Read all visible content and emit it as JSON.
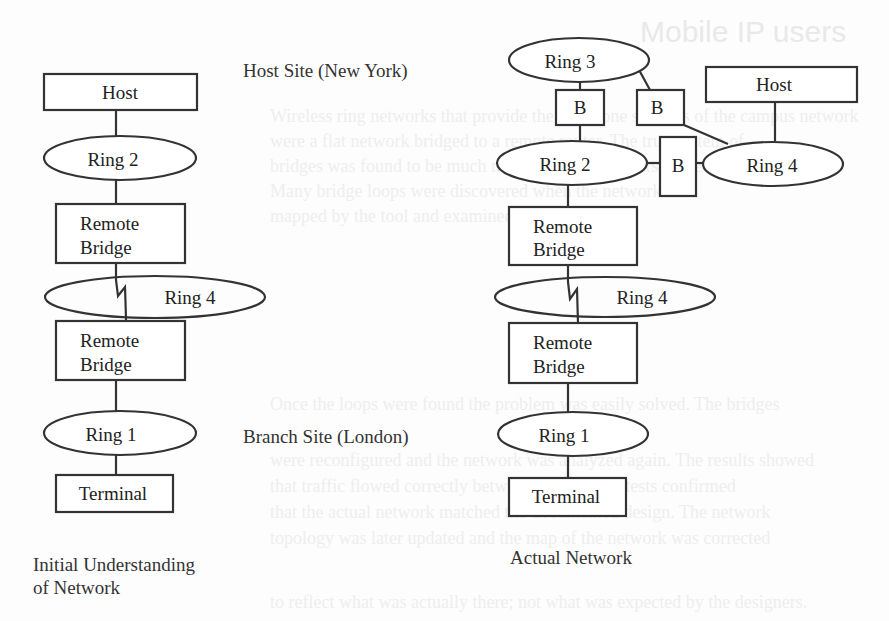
{
  "background_bleed": {
    "heading": "Mobile IP users",
    "body_lines": [
      "Wireless ring networks that provide the backbone services of the campus network",
      "were a flat network bridged to a remote router. The true system of",
      "bridges was found to be much more complex than first expected.",
      "Many bridge loops were discovered when the network was",
      "mapped by the tool and examined carefully.",
      "",
      "",
      "",
      "",
      "Once the loops were found the problem was easily solved. The bridges",
      "were reconfigured and the network was analyzed again. The results showed",
      "that traffic flowed correctly between sites. These tests confirmed",
      "that the actual network matched the documented design. The network",
      "topology was later updated and the map of the network was corrected",
      "to reflect what was actually there; not what was expected by the designers."
    ]
  },
  "left_diagram": {
    "caption": [
      "Initial Understanding",
      "of Network"
    ],
    "site_labels": {
      "host_site": "Host Site (New York)",
      "branch_site": "Branch Site (London)"
    },
    "nodes": {
      "host": "Host",
      "ring2": "Ring 2",
      "bridge_top": [
        "Remote",
        "Bridge"
      ],
      "ring4": "Ring 4",
      "bridge_bottom": [
        "Remote",
        "Bridge"
      ],
      "ring1": "Ring 1",
      "terminal": "Terminal"
    }
  },
  "right_diagram": {
    "caption": "Actual Network",
    "nodes": {
      "ring3": "Ring 3",
      "b_left": "B",
      "b_right": "B",
      "host": "Host",
      "ring2": "Ring 2",
      "b_middle": "B",
      "ring4_upper": "Ring 4",
      "bridge_top": [
        "Remote",
        "Bridge"
      ],
      "ring4_lower": "Ring 4",
      "bridge_bottom": [
        "Remote",
        "Bridge"
      ],
      "ring1": "Ring 1",
      "terminal": "Terminal"
    }
  },
  "colors": {
    "stroke": "#333333",
    "text": "#222222",
    "background": "#fdfdfd"
  }
}
